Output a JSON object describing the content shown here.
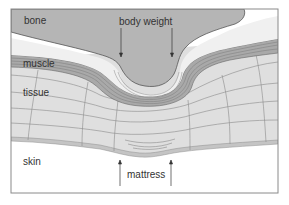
{
  "diagram": {
    "labels": {
      "bone": "bone",
      "body_weight": "body weight",
      "muscle": "muscle",
      "tissue": "tissue",
      "skin": "skin",
      "mattress": "mattress"
    },
    "colors": {
      "bone": "#b5b5b5",
      "fat": "#f0f0f0",
      "muscle": "#a9a9a9",
      "tissue": "#dfdfdf",
      "skin": "#c4c4c4",
      "outline": "#555555",
      "frame": "#8a8a8a",
      "background": "#ffffff"
    }
  }
}
